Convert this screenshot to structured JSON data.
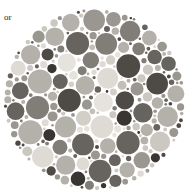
{
  "page": {
    "background_color": "#ffffff",
    "width": 190,
    "height": 195
  },
  "caption": {
    "text": "or",
    "note": "fragment of a word clipped by the left page margin",
    "color": "#1a1a1a"
  },
  "plate": {
    "title": "ishihara-color-vision-test-plate",
    "rendering": "grayscale",
    "shape": "circle",
    "center_x": 91.5,
    "center_y": 91.5,
    "radius": 91.5,
    "background_color": "#ffffff",
    "hidden_figure": "2",
    "hidden_figure_tone": "#d6d4cf",
    "dot_count": 640,
    "dot_min_radius": 1.2,
    "dot_max_radius": 11.5,
    "palette": {
      "very_light": "#dedbd5",
      "light": "#cbc8c1",
      "light_mid": "#b4b1aa",
      "mid": "#9a9791",
      "mid_dark": "#817e78",
      "dark": "#67645f",
      "very_dark": "#4e4b47",
      "near_black": "#383532"
    },
    "figure_palette": {
      "bright": "#e6e3dd",
      "pale": "#d2cfc8",
      "soft": "#c2bfb8"
    }
  },
  "chart_data": {
    "type": "scatter",
    "xlabel": "",
    "ylabel": "",
    "xlim": [
      0,
      183
    ],
    "ylim": [
      0,
      183
    ],
    "grid": false,
    "legend": null,
    "annotations": [
      "or"
    ],
    "series": [
      {
        "name": "background-dots",
        "description": "confusion-field dots in mixed mid and dark grey tones filling the plate",
        "tones": [
          "#dedbd5",
          "#cbc8c1",
          "#b4b1aa",
          "#9a9791",
          "#817e78",
          "#67645f",
          "#4e4b47",
          "#383532"
        ]
      },
      {
        "name": "figure-dots",
        "description": "lighter dots whose collective shape spells the hidden numeral 2",
        "tones": [
          "#e6e3dd",
          "#d2cfc8",
          "#c2bfb8"
        ]
      }
    ]
  }
}
